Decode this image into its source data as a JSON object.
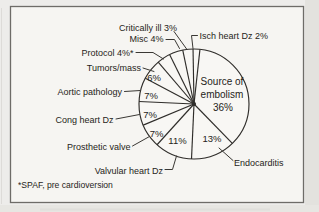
{
  "chart_data": {
    "type": "pie",
    "order": "clockwise-from-top",
    "slices": [
      {
        "label": "Isch heart Dz",
        "value": 2
      },
      {
        "label": "Source of embolism",
        "value": 36
      },
      {
        "label": "Endocarditis",
        "value": 13
      },
      {
        "label": "Valvular heart Dz",
        "value": 11
      },
      {
        "label": "Prosthetic valve",
        "value": 7
      },
      {
        "label": "Cong heart Dz",
        "value": 7
      },
      {
        "label": "Aortic pathology",
        "value": 7
      },
      {
        "label": "Tumors/mass",
        "value": 6
      },
      {
        "label": "Protocol",
        "value": 4,
        "footnote_marker": "*"
      },
      {
        "label": "Misc",
        "value": 4
      },
      {
        "label": "Critically ill",
        "value": 3
      }
    ],
    "footnote": "*SPAF, pre cardioversion",
    "legend_position": "callout-labels",
    "colors": {
      "ink": "#2f2d2a",
      "paper": "#f6f5f2",
      "page": "#edecea"
    }
  },
  "labels": {
    "critically_ill": "Critically ill 3%",
    "misc": "Misc 4%",
    "protocol": "Protocol 4%*",
    "tumors": "Tumors/mass",
    "aortic": "Aortic pathology",
    "cong": "Cong heart Dz",
    "prosthetic": "Prosthetic valve",
    "valvular": "Valvular heart Dz",
    "isch": "Isch heart Dz 2%",
    "endocarditis": "Endocarditis",
    "source_line1": "Source of",
    "source_line2": "embolism",
    "source_line3": "36%",
    "pct_6": "6%",
    "pct_7a": "7%",
    "pct_7b": "7%",
    "pct_7c": "7%",
    "pct_11": "11%",
    "pct_13": "13%",
    "footnote": "*SPAF, pre cardioversion"
  }
}
